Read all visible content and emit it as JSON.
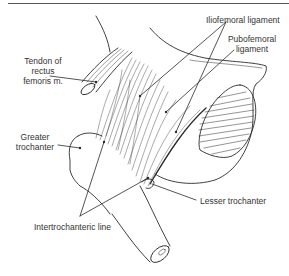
{
  "figure": {
    "labels": {
      "iliofemoral": "Iliofemoral ligament",
      "pubofemoral_1": "Pubofemoral",
      "pubofemoral_2": "ligament",
      "tendon_1": "Tendon of",
      "tendon_2": "rectus",
      "tendon_3": "femoris m.",
      "greater_1": "Greater",
      "greater_2": "trochanter",
      "lesser": "Lesser trochanter",
      "intertrochanteric": "Intertrochanteric line"
    },
    "colors": {
      "line": "#2a2a2a",
      "text": "#333333",
      "background": "#ffffff"
    }
  }
}
